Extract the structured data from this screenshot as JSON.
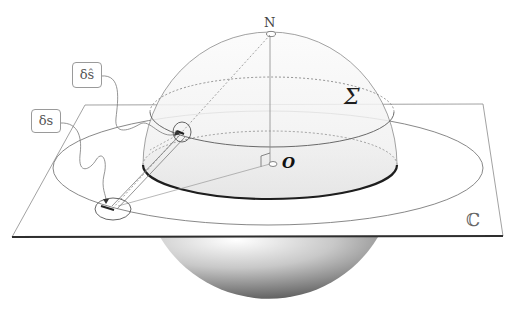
{
  "diagram": {
    "labels": {
      "north_pole": "N",
      "sphere": "Σ",
      "origin": "O",
      "plane": "ℂ",
      "delta_s_hat": "δŝ",
      "delta_s": "δs"
    },
    "colors": {
      "background": "#ffffff",
      "line": "#7a7a7a",
      "dark_edge": "#2a2a2a",
      "sphere_shade_light": "#f4f4f4",
      "sphere_shade_dark": "#6a6a6a"
    }
  }
}
